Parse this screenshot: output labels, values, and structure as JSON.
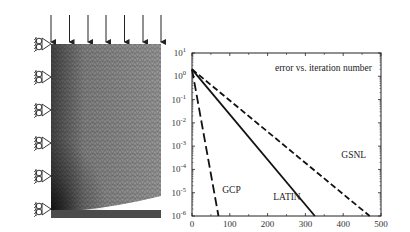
{
  "mesh_panel": {
    "description": "2D finite element mesh with distributed top load and roller supports on left edge",
    "load_arrows": 7,
    "supports": 6,
    "colors": {
      "mesh_light": "#9a9a9a",
      "mesh_dark": "#3a3a3a",
      "outline": "#222222"
    }
  },
  "chart_data": {
    "type": "line",
    "title": "error vs. iteration number",
    "xlabel": "",
    "ylabel": "",
    "xlim": [
      0,
      500
    ],
    "ylim_log10": [
      -6,
      1
    ],
    "yscale": "log",
    "x_ticks": [
      "0",
      "100",
      "200",
      "300",
      "400",
      "500"
    ],
    "y_ticks": [
      "10^1",
      "10^0",
      "10^-1",
      "10^-2",
      "10^-3",
      "10^-4",
      "10^-5",
      "10^-6"
    ],
    "grid": false,
    "series": [
      {
        "name": "GCP",
        "style": "long-dash",
        "x": [
          0,
          70
        ],
        "y_log10": [
          0.3,
          -6
        ]
      },
      {
        "name": "LATIN",
        "style": "solid",
        "x": [
          0,
          325
        ],
        "y_log10": [
          0.3,
          -6
        ]
      },
      {
        "name": "GSNL",
        "style": "dashed",
        "x": [
          0,
          470
        ],
        "y_log10": [
          0.3,
          -6
        ]
      }
    ],
    "annotations": [
      {
        "text": "GCP",
        "x": 80,
        "y_log10": -5.0
      },
      {
        "text": "LATIN",
        "x": 215,
        "y_log10": -5.3
      },
      {
        "text": "GSNL",
        "x": 395,
        "y_log10": -3.5
      }
    ]
  }
}
